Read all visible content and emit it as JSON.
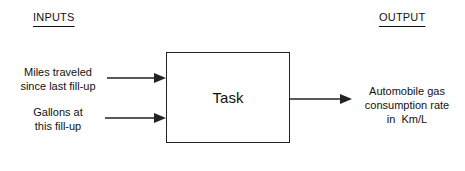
{
  "diagram": {
    "headers": {
      "inputs": "INPUTS",
      "output": "OUTPUT"
    },
    "inputs": [
      {
        "line1": "Miles traveled",
        "line2": "since last fill-up"
      },
      {
        "line1": "Gallons at",
        "line2": "this fill-up"
      }
    ],
    "process": {
      "label": "Task"
    },
    "output": {
      "line1": "Automobile gas",
      "line2": "consumption rate",
      "line3": "in  Km/L"
    },
    "colors": {
      "line": "#222222",
      "background": "#ffffff"
    }
  }
}
